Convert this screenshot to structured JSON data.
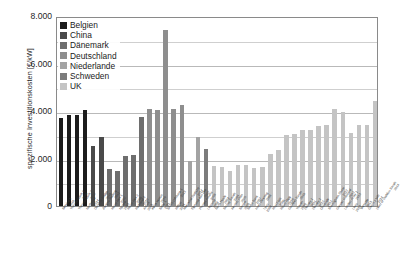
{
  "axes": {
    "y_title": "spezifische Investitionskosten [€/kW]",
    "y_ticks": [
      "8.000",
      "6.000",
      "4.000",
      "2.000",
      "0"
    ],
    "x_title": ""
  },
  "legend": {
    "position": "top-left-inside",
    "items": [
      {
        "label": "Belgien",
        "color": "#1c1c1c"
      },
      {
        "label": "China",
        "color": "#4a4a4a"
      },
      {
        "label": "Dänemark",
        "color": "#6e6e6e"
      },
      {
        "label": "Deutschland",
        "color": "#8e8e8e"
      },
      {
        "label": "Niederlande",
        "color": "#a3a3a3"
      },
      {
        "label": "Schweden",
        "color": "#7c7c7c"
      },
      {
        "label": "UK",
        "color": "#c4c4c4"
      }
    ]
  },
  "chart_data": {
    "type": "bar",
    "title": "",
    "xlabel": "",
    "ylabel": "spezifische Investitionskosten [€/kW]",
    "ylim": [
      0,
      8000
    ],
    "ytick_values": [
      0,
      2000,
      4000,
      6000,
      8000
    ],
    "grid": true,
    "grid_axis": "y",
    "series": [
      {
        "name": "Belgien",
        "color": "#1c1c1c"
      },
      {
        "name": "China",
        "color": "#4a4a4a"
      },
      {
        "name": "Dänemark",
        "color": "#6e6e6e"
      },
      {
        "name": "Deutschland",
        "color": "#8e8e8e"
      },
      {
        "name": "Niederlande",
        "color": "#a3a3a3"
      },
      {
        "name": "Schweden",
        "color": "#7c7c7c"
      },
      {
        "name": "UK",
        "color": "#c4c4c4"
      }
    ],
    "bars": [
      {
        "label": "Belwind 1\n2010",
        "series": "Belgien",
        "value": 3700
      },
      {
        "label": "Thorntonbank 1\n2009",
        "series": "Belgien",
        "value": 3820
      },
      {
        "label": "Thorntonbank 2\n2012",
        "series": "Belgien",
        "value": 3850
      },
      {
        "label": "Northwind\n2014",
        "series": "Belgien",
        "value": 4050
      },
      {
        "label": "Donghai Bridge\n2010",
        "series": "China",
        "value": 2520
      },
      {
        "label": "Jiangsu Rudong\n2012",
        "series": "China",
        "value": 2900
      },
      {
        "label": "Horns Rev 1\n2002",
        "series": "Dänemark",
        "value": 1560
      },
      {
        "label": "Nysted\n2003",
        "series": "Dänemark",
        "value": 1480
      },
      {
        "label": "Horns Rev 2\n2009",
        "series": "Dänemark",
        "value": 2120
      },
      {
        "label": "Rødsand 2\n2010",
        "series": "Dänemark",
        "value": 2150
      },
      {
        "label": "Anholt\n2013",
        "series": "Dänemark",
        "value": 3760
      },
      {
        "label": "alpha ventus\n2010",
        "series": "Deutschland",
        "value": 4080
      },
      {
        "label": "Baltic 1\n2011",
        "series": "Deutschland",
        "value": 4050
      },
      {
        "label": "BARD Offshore 1\n2013",
        "series": "Deutschland",
        "value": 7400
      },
      {
        "label": "Riffgat\n2014",
        "series": "Deutschland",
        "value": 4080
      },
      {
        "label": "Meerwind Süd/Ost\n2014",
        "series": "Deutschland",
        "value": 4250
      },
      {
        "label": "Egmond aan Zee\n2007",
        "series": "Niederlande",
        "value": 1880
      },
      {
        "label": "Prinses Amalia\n2008",
        "series": "Niederlande",
        "value": 2900
      },
      {
        "label": "Lillgrund\n2008",
        "series": "Schweden",
        "value": 2420
      },
      {
        "label": "North Hoyle\n2004",
        "series": "UK",
        "value": 1700
      },
      {
        "label": "Scroby Sands\n2004",
        "series": "UK",
        "value": 1660
      },
      {
        "label": "Kentish Flats\n2005",
        "series": "UK",
        "value": 1480
      },
      {
        "label": "Barrow\n2006",
        "series": "UK",
        "value": 1740
      },
      {
        "label": "Burbo Bank\n2007",
        "series": "UK",
        "value": 1720
      },
      {
        "label": "Inner Dowsing\n2008",
        "series": "UK",
        "value": 1620
      },
      {
        "label": "Lynn\n2008",
        "series": "UK",
        "value": 1640
      },
      {
        "label": "Rhyl Flats\n2009",
        "series": "UK",
        "value": 2180
      },
      {
        "label": "Robin Rigg\n2010",
        "series": "UK",
        "value": 2340
      },
      {
        "label": "Gunfleet Sands\n2010",
        "series": "UK",
        "value": 2980
      },
      {
        "label": "Thanet\n2010",
        "series": "UK",
        "value": 3050
      },
      {
        "label": "Walney 1\n2011",
        "series": "UK",
        "value": 3200
      },
      {
        "label": "Walney 2\n2012",
        "series": "UK",
        "value": 3220
      },
      {
        "label": "Ormonde\n2012",
        "series": "UK",
        "value": 3350
      },
      {
        "label": "Sheringham Shoal\n2012",
        "series": "UK",
        "value": 3400
      },
      {
        "label": "Greater Gabbard\n2012",
        "series": "UK",
        "value": 4080
      },
      {
        "label": "London Array 1\n2013",
        "series": "UK",
        "value": 3950
      },
      {
        "label": "Lincs\n2013",
        "series": "UK",
        "value": 3070
      },
      {
        "label": "Teesside\n2013",
        "series": "UK",
        "value": 3400
      },
      {
        "label": "Gwynt y Môr\n2014",
        "series": "UK",
        "value": 3420
      },
      {
        "label": "West of Duddon Sands\n2014",
        "series": "UK",
        "value": 4420
      }
    ]
  }
}
